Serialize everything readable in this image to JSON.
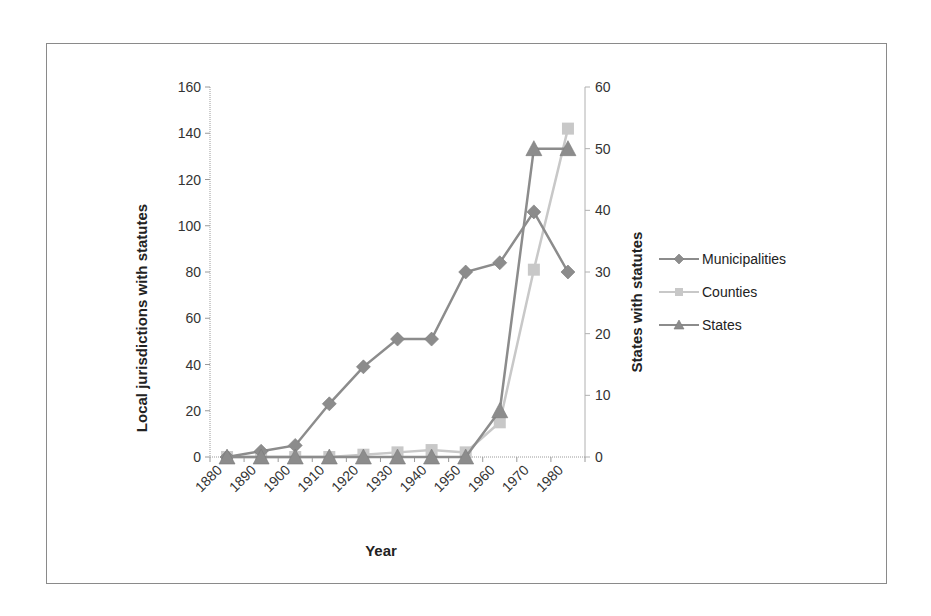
{
  "chart_data": {
    "type": "line",
    "title": "",
    "categories": [
      "1880",
      "1890",
      "1900",
      "1910",
      "1920",
      "1930",
      "1940",
      "1950",
      "1960",
      "1970",
      "1980"
    ],
    "xlabel": "Year",
    "ylabel": "Local jurisdictions with statutes",
    "y2label": "States with statutes",
    "ylim": [
      0,
      160
    ],
    "y2lim": [
      0,
      60
    ],
    "yticks": [
      0,
      20,
      40,
      60,
      80,
      100,
      120,
      140,
      160
    ],
    "y2ticks": [
      0,
      10,
      20,
      30,
      40,
      50,
      60
    ],
    "grid": false,
    "legend_position": "right",
    "series": [
      {
        "name": "Municipalities",
        "axis": "left",
        "marker": "diamond",
        "color": "#8c8c8c",
        "values": [
          0,
          2.5,
          5,
          23,
          39,
          51,
          51,
          80,
          84,
          106,
          80
        ]
      },
      {
        "name": "Counties",
        "axis": "left",
        "marker": "square",
        "color": "#c8c8c8",
        "values": [
          0,
          0,
          0,
          0,
          1,
          2,
          3,
          2,
          15,
          81,
          142
        ]
      },
      {
        "name": "States",
        "axis": "right",
        "marker": "triangle",
        "color": "#8c8c8c",
        "values": [
          0,
          0,
          0,
          0,
          0,
          0,
          0,
          0,
          7.5,
          50,
          50
        ]
      }
    ]
  },
  "legend": {
    "items": [
      {
        "label": "Municipalities",
        "marker": "diamond"
      },
      {
        "label": "Counties",
        "marker": "square"
      },
      {
        "label": "States",
        "marker": "triangle"
      }
    ]
  },
  "axes": {
    "x_title": "Year",
    "y_left_title": "Local jurisdictions with statutes",
    "y_right_title": "States with statutes"
  }
}
